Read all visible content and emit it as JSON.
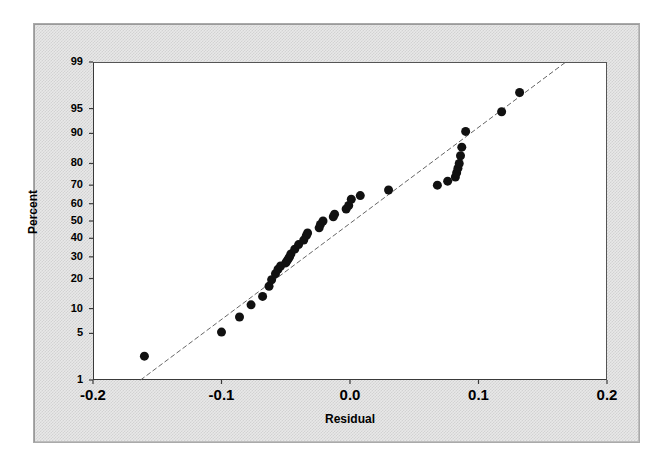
{
  "chart_data": {
    "type": "scatter",
    "title": "",
    "subtitle": "",
    "xlabel": "Residual",
    "ylabel": "Percent",
    "scale": "normal-probability",
    "grid": false,
    "legend": null,
    "xlim": [
      -0.2,
      0.2
    ],
    "ylim": [
      1,
      99
    ],
    "xticks": [
      "-0.2",
      "-0.1",
      "0.0",
      "0.1",
      "0.2"
    ],
    "xtick_values": [
      -0.2,
      -0.1,
      0.0,
      0.1,
      0.2
    ],
    "yticks": [
      "1",
      "5",
      "10",
      "20",
      "30",
      "40",
      "50",
      "60",
      "70",
      "80",
      "90",
      "95",
      "99"
    ],
    "ytick_values": [
      1,
      5,
      10,
      20,
      30,
      40,
      50,
      60,
      70,
      80,
      90,
      95,
      99
    ],
    "marker": "filled-circle",
    "marker_color": "#111111",
    "marker_size_px": 9,
    "reference_line": {
      "style": "dashed",
      "color": "#666666",
      "x_start": -0.163,
      "y_start": 1,
      "x_end": 0.168,
      "y_end": 99
    },
    "series": [
      {
        "name": "Residual",
        "x": [
          -0.16,
          -0.1,
          -0.086,
          -0.077,
          -0.068,
          -0.063,
          -0.061,
          -0.058,
          -0.056,
          -0.054,
          -0.05,
          -0.049,
          -0.048,
          -0.047,
          -0.046,
          -0.043,
          -0.04,
          -0.036,
          -0.034,
          -0.033,
          -0.024,
          -0.023,
          -0.021,
          -0.013,
          -0.012,
          -0.003,
          -0.001,
          0.001,
          0.008,
          0.03,
          0.068,
          0.076,
          0.082,
          0.083,
          0.084,
          0.085,
          0.086,
          0.087,
          0.09,
          0.118,
          0.132
        ],
        "percent": [
          2.4,
          5.2,
          8.0,
          11.0,
          13.5,
          17.0,
          19.5,
          22.0,
          24.0,
          25.5,
          27.0,
          28.0,
          29.0,
          30.0,
          31.5,
          34.0,
          36.5,
          39.0,
          41.5,
          43.0,
          46.0,
          48.0,
          50.0,
          52.5,
          54.0,
          57.0,
          59.0,
          62.5,
          64.5,
          67.5,
          70.0,
          72.0,
          74.0,
          76.0,
          78.0,
          80.0,
          83.0,
          86.0,
          90.5,
          94.5,
          97.0
        ]
      }
    ]
  },
  "axes": {
    "x_label": "Residual",
    "y_label": "Percent"
  }
}
